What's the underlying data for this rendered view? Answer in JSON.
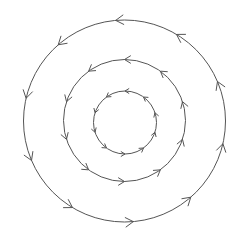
{
  "diagram": {
    "type": "concentric-circulation",
    "background": "#ffffff",
    "stroke_color": "#555555",
    "direction": "counter-clockwise",
    "circles": [
      {
        "name": "outer-circle",
        "cx": 124.5,
        "cy": 121,
        "r": 101,
        "arrow_count": 10,
        "arrow_offset_deg": 95,
        "arrow_size": 9
      },
      {
        "name": "middle-circle",
        "cx": 124.5,
        "cy": 120.5,
        "r": 61,
        "arrow_count": 10,
        "arrow_offset_deg": 90,
        "arrow_size": 7
      },
      {
        "name": "inner-circle",
        "cx": 125,
        "cy": 122.5,
        "r": 31.5,
        "arrow_count": 10,
        "arrow_offset_deg": 90,
        "arrow_size": 4.5
      }
    ]
  }
}
